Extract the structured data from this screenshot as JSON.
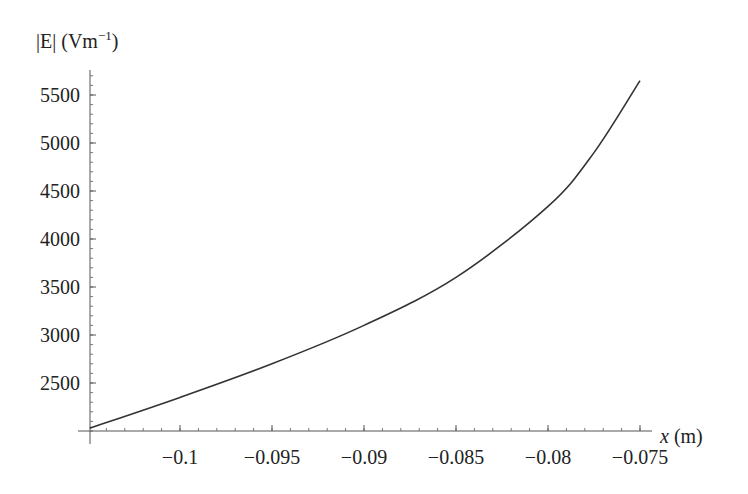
{
  "chart_data": {
    "type": "line",
    "title": "",
    "xlabel": "x (m)",
    "ylabel": "|E| (Vm^-1)",
    "ylabel_parts": {
      "main": "|E| (Vm",
      "sup": "−1",
      "close": ")"
    },
    "xlabel_parts": {
      "var": "x",
      "unit": " (m)"
    },
    "xlim": [
      -0.1049,
      -0.075
    ],
    "ylim": [
      2000,
      5700
    ],
    "grid": false,
    "legend": null,
    "x_ticks": [
      -0.1,
      -0.095,
      -0.09,
      -0.085,
      -0.08,
      -0.075
    ],
    "x_tick_labels": [
      "−0.1",
      "−0.095",
      "−0.09",
      "−0.085",
      "−0.08",
      "−0.075"
    ],
    "y_ticks": [
      2500,
      3000,
      3500,
      4000,
      4500,
      5000,
      5500
    ],
    "y_tick_labels": [
      "2500",
      "3000",
      "3500",
      "4000",
      "4500",
      "5000",
      "5500"
    ],
    "series": [
      {
        "name": "|E|",
        "color": "#333333",
        "x": [
          -0.1049,
          -0.1,
          -0.095,
          -0.09,
          -0.085,
          -0.08,
          -0.0775,
          -0.075
        ],
        "values": [
          2030,
          2350,
          2700,
          3100,
          3600,
          4340,
          4900,
          5650
        ]
      }
    ]
  }
}
